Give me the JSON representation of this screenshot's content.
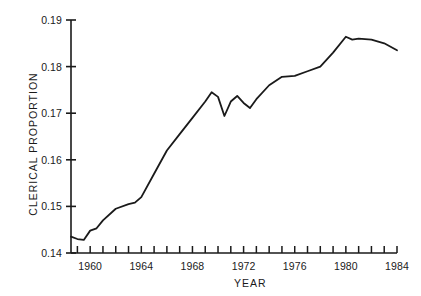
{
  "chart_data": {
    "type": "line",
    "title": "",
    "xlabel": "YEAR",
    "ylabel": "CLERICAL PROPORTION",
    "xlim": [
      1958.5,
      1984.0
    ],
    "ylim": [
      0.14,
      0.19
    ],
    "grid": false,
    "legend": null,
    "xticks": [
      1959,
      1960,
      1961,
      1962,
      1963,
      1964,
      1965,
      1966,
      1967,
      1968,
      1969,
      1970,
      1971,
      1972,
      1973,
      1974,
      1975,
      1976,
      1977,
      1978,
      1979,
      1980,
      1981,
      1982,
      1983,
      1984
    ],
    "xtick_labels": [
      "",
      "1960",
      "",
      "",
      "",
      "1964",
      "",
      "",
      "",
      "1968",
      "",
      "",
      "",
      "1972",
      "",
      "",
      "",
      "1976",
      "",
      "",
      "",
      "1980",
      "",
      "",
      "",
      "1984"
    ],
    "yticks": [
      0.14,
      0.15,
      0.16,
      0.17,
      0.18,
      0.19
    ],
    "ytick_labels": [
      "0.14",
      "0.15",
      "0.16",
      "0.17",
      "0.18",
      "0.19"
    ],
    "line_color": "#1a1a1a",
    "line_width": 1.8,
    "x": [
      1958.5,
      1959.0,
      1959.5,
      1960.0,
      1960.5,
      1961.0,
      1962.0,
      1963.0,
      1963.5,
      1964.0,
      1965.0,
      1966.0,
      1967.0,
      1968.0,
      1969.0,
      1969.5,
      1970.0,
      1970.5,
      1971.0,
      1971.5,
      1972.0,
      1972.5,
      1973.0,
      1974.0,
      1975.0,
      1976.0,
      1977.0,
      1978.0,
      1979.0,
      1980.0,
      1980.5,
      1981.0,
      1982.0,
      1983.0,
      1984.0
    ],
    "y": [
      0.1435,
      0.143,
      0.1428,
      0.1448,
      0.1453,
      0.147,
      0.1495,
      0.1505,
      0.1508,
      0.152,
      0.157,
      0.162,
      0.1655,
      0.169,
      0.1725,
      0.1745,
      0.1735,
      0.1694,
      0.1725,
      0.1737,
      0.1722,
      0.1711,
      0.173,
      0.176,
      0.1778,
      0.178,
      0.179,
      0.18,
      0.183,
      0.1864,
      0.1858,
      0.186,
      0.1858,
      0.185,
      0.1835
    ],
    "annotations": []
  },
  "axes": {
    "y_axis_name": "clerical-proportion-axis",
    "x_axis_name": "year-axis"
  }
}
